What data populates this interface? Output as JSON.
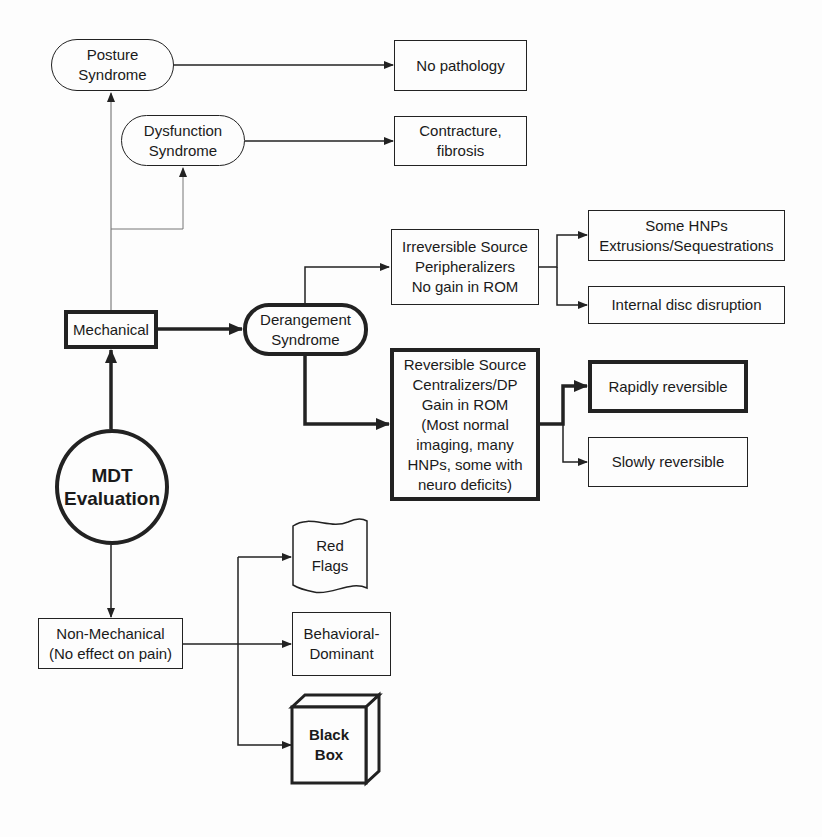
{
  "diagram": {
    "colors": {
      "line": "#222222",
      "background": "#fdfdfd"
    },
    "nodes": {
      "mdt_evaluation": "MDT\nEvaluation",
      "mechanical": "Mechanical",
      "non_mechanical": "Non-Mechanical\n(No effect on pain)",
      "posture_syndrome": "Posture\nSyndrome",
      "dysfunction_syndrome": "Dysfunction\nSyndrome",
      "derangement_syndrome": "Derangement\nSyndrome",
      "no_pathology": "No pathology",
      "contracture_fibrosis": "Contracture,\nfibrosis",
      "irreversible_source": "Irreversible Source\nPeripheralizers\nNo gain in ROM",
      "some_hnps": "Some HNPs\nExtrusions/Sequestrations",
      "internal_disc_disruption": "Internal disc disruption",
      "reversible_source": "Reversible Source\nCentralizers/DP\nGain in ROM\n(Most normal\nimaging, many\nHNPs, some with\nneuro deficits)",
      "rapidly_reversible": "Rapidly reversible",
      "slowly_reversible": "Slowly reversible",
      "red_flags": "Red\nFlags",
      "behavioral_dominant": "Behavioral-\nDominant",
      "black_box": "Black\nBox"
    }
  }
}
